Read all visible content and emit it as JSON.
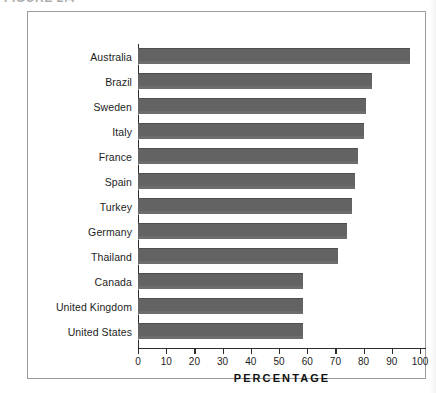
{
  "caption": {
    "text": "FIGURE 2.4"
  },
  "chart_data": {
    "type": "bar",
    "orientation": "horizontal",
    "title": "",
    "subtitle": "",
    "xlabel": "PERCENTAGE",
    "ylabel": "",
    "xlim": [
      0,
      100
    ],
    "xticks": [
      0,
      10,
      20,
      30,
      40,
      50,
      60,
      70,
      80,
      90,
      100
    ],
    "xtick_labels": [
      "0",
      "10",
      "20",
      "30",
      "40",
      "50",
      "60",
      "70",
      "80",
      "90",
      "100"
    ],
    "grid": false,
    "legend": false,
    "bar_color": "#636363",
    "frame_color": "#9b9b9b",
    "axis_color": "#2b2b2b",
    "categories": [
      "Australia",
      "Brazil",
      "Sweden",
      "Italy",
      "France",
      "Spain",
      "Turkey",
      "Germany",
      "Thailand",
      "Canada",
      "United Kingdom",
      "United States"
    ],
    "values": [
      96.5,
      83,
      81,
      80,
      78,
      77,
      76,
      74,
      71,
      58.5,
      58.5,
      58.5
    ],
    "series": [
      {
        "name": "Percentage",
        "values": [
          96.5,
          83,
          81,
          80,
          78,
          77,
          76,
          74,
          71,
          58.5,
          58.5,
          58.5
        ]
      }
    ]
  }
}
